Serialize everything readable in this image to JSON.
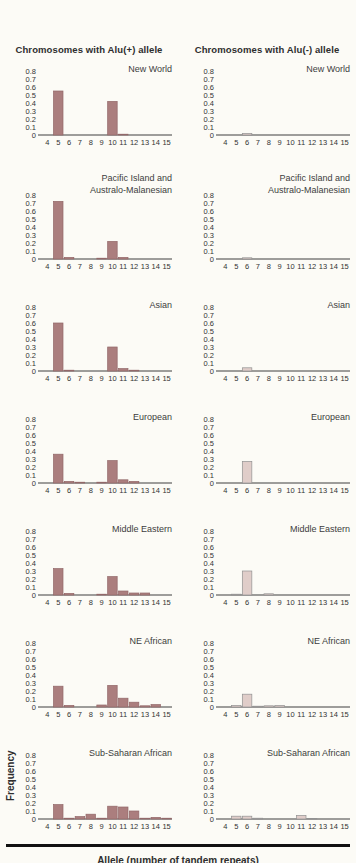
{
  "page": {
    "left_header": "Chromosomes with Alu(+) allele",
    "right_header": "Chromosomes with Alu(-) allele",
    "x_axis_label": "Allele (number of tandem repeats)",
    "y_axis_label": "Frequency"
  },
  "colors": {
    "alu_plus_fill": "#ab7e7e",
    "alu_plus_stroke": "#926768",
    "alu_minus_fill": "#e0cdc9",
    "alu_minus_stroke": "#929292",
    "axis": "#3f3f3f",
    "background": "#fcfbf6"
  },
  "chart_data": {
    "type": "bar",
    "x_categories": [
      4,
      5,
      6,
      7,
      8,
      9,
      10,
      11,
      12,
      13,
      14,
      15
    ],
    "xlabel": "Allele (number of tandem repeats)",
    "ylabel": "Frequency",
    "ylim": [
      0,
      0.8
    ],
    "yticks": [
      0.8,
      0.7,
      0.6,
      0.5,
      0.4,
      0.3,
      0.2,
      0.1,
      0
    ],
    "grid": false,
    "columns": [
      "Chromosomes with Alu(+) allele",
      "Chromosomes with Alu(-) allele"
    ],
    "rows": [
      {
        "population": "New World",
        "title_lines": [
          "New World"
        ],
        "alu_plus": [
          0,
          0.55,
          0,
          0,
          0,
          0,
          0.42,
          0.01,
          0,
          0,
          0,
          0
        ],
        "alu_minus": [
          0,
          0,
          0.02,
          0,
          0,
          0,
          0,
          0,
          0,
          0,
          0,
          0
        ]
      },
      {
        "population": "Pacific Island and Australo-Malanesian",
        "title_lines": [
          "Pacific Island and",
          "Australo-Malanesian"
        ],
        "alu_plus": [
          0,
          0.72,
          0.02,
          0,
          0,
          0.01,
          0.22,
          0.02,
          0,
          0,
          0,
          0
        ],
        "alu_minus": [
          0,
          0,
          0.015,
          0,
          0,
          0,
          0,
          0,
          0,
          0,
          0,
          0
        ]
      },
      {
        "population": "Asian",
        "title_lines": [
          "Asian"
        ],
        "alu_plus": [
          0,
          0.6,
          0.01,
          0,
          0,
          0,
          0.3,
          0.03,
          0.01,
          0,
          0,
          0
        ],
        "alu_minus": [
          0,
          0,
          0.04,
          0,
          0,
          0,
          0,
          0,
          0,
          0,
          0,
          0
        ]
      },
      {
        "population": "European",
        "title_lines": [
          "European"
        ],
        "alu_plus": [
          0,
          0.36,
          0.02,
          0.01,
          0,
          0.01,
          0.28,
          0.04,
          0.02,
          0,
          0,
          0
        ],
        "alu_minus": [
          0,
          0,
          0.27,
          0,
          0,
          0,
          0,
          0,
          0,
          0,
          0,
          0
        ]
      },
      {
        "population": "Middle Eastern",
        "title_lines": [
          "Middle Eastern"
        ],
        "alu_plus": [
          0,
          0.33,
          0.02,
          0,
          0,
          0.01,
          0.23,
          0.05,
          0.025,
          0.025,
          0,
          0
        ],
        "alu_minus": [
          0,
          0.01,
          0.3,
          0,
          0.015,
          0,
          0,
          0,
          0,
          0,
          0,
          0
        ]
      },
      {
        "population": "NE African",
        "title_lines": [
          "NE African"
        ],
        "alu_plus": [
          0,
          0.26,
          0.02,
          0,
          0,
          0.025,
          0.27,
          0.11,
          0.06,
          0.015,
          0.03,
          0
        ],
        "alu_minus": [
          0,
          0.02,
          0.16,
          0.01,
          0.015,
          0.02,
          0,
          0,
          0,
          0,
          0,
          0
        ]
      },
      {
        "population": "Sub-Saharan African",
        "title_lines": [
          "Sub-Saharan African"
        ],
        "alu_plus": [
          0,
          0.18,
          0.01,
          0.03,
          0.06,
          0.01,
          0.16,
          0.15,
          0.1,
          0.01,
          0.02,
          0.01
        ],
        "alu_minus": [
          0,
          0.035,
          0.035,
          0.01,
          0,
          0,
          0,
          0.045,
          0.005,
          0,
          0,
          0
        ]
      }
    ]
  }
}
